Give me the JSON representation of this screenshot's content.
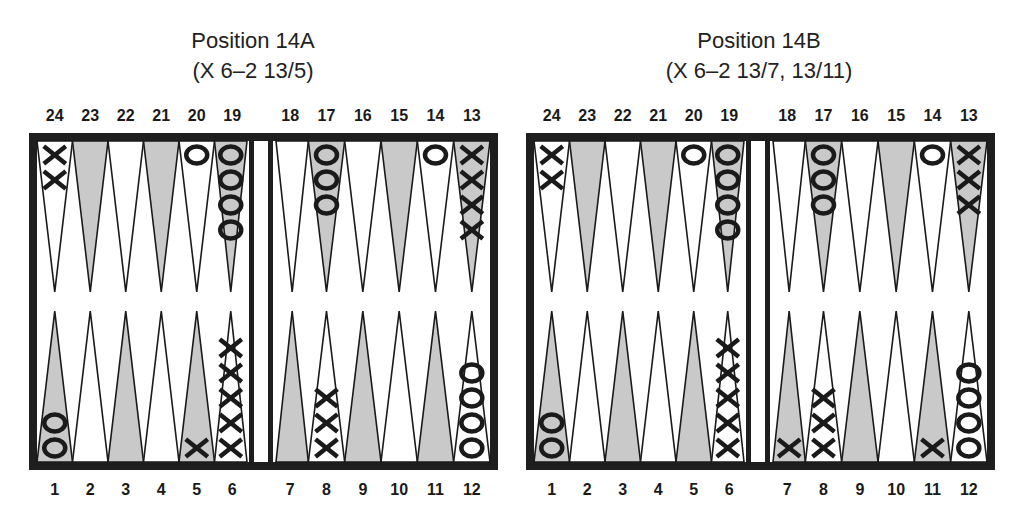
{
  "colors": {
    "frame": "#1e1e1e",
    "shaded_point": "#c9c9c9",
    "plain_point": "#ffffff",
    "background": "#ffffff",
    "ink": "#1a1a1a"
  },
  "panels": [
    {
      "id": "14A",
      "title": "Position 14A",
      "subtitle": "(X 6–2 13/5)",
      "top_numbers": [
        "24",
        "23",
        "22",
        "21",
        "20",
        "19",
        "18",
        "17",
        "16",
        "15",
        "14",
        "13"
      ],
      "bottom_numbers": [
        "1",
        "2",
        "3",
        "4",
        "5",
        "6",
        "7",
        "8",
        "9",
        "10",
        "11",
        "12"
      ],
      "points": {
        "1": {
          "player": "O",
          "count": 2
        },
        "2": {
          "player": "",
          "count": 0
        },
        "3": {
          "player": "",
          "count": 0
        },
        "4": {
          "player": "",
          "count": 0
        },
        "5": {
          "player": "X",
          "count": 1
        },
        "6": {
          "player": "X",
          "count": 5
        },
        "7": {
          "player": "",
          "count": 0
        },
        "8": {
          "player": "X",
          "count": 3
        },
        "9": {
          "player": "",
          "count": 0
        },
        "10": {
          "player": "",
          "count": 0
        },
        "11": {
          "player": "",
          "count": 0
        },
        "12": {
          "player": "O",
          "count": 4
        },
        "13": {
          "player": "X",
          "count": 4
        },
        "14": {
          "player": "O",
          "count": 1
        },
        "15": {
          "player": "",
          "count": 0
        },
        "16": {
          "player": "",
          "count": 0
        },
        "17": {
          "player": "O",
          "count": 3
        },
        "18": {
          "player": "",
          "count": 0
        },
        "19": {
          "player": "O",
          "count": 4
        },
        "20": {
          "player": "O",
          "count": 1
        },
        "21": {
          "player": "",
          "count": 0
        },
        "22": {
          "player": "",
          "count": 0
        },
        "23": {
          "player": "",
          "count": 0
        },
        "24": {
          "player": "X",
          "count": 2
        }
      }
    },
    {
      "id": "14B",
      "title": "Position 14B",
      "subtitle": "(X 6–2 13/7, 13/11)",
      "top_numbers": [
        "24",
        "23",
        "22",
        "21",
        "20",
        "19",
        "18",
        "17",
        "16",
        "15",
        "14",
        "13"
      ],
      "bottom_numbers": [
        "1",
        "2",
        "3",
        "4",
        "5",
        "6",
        "7",
        "8",
        "9",
        "10",
        "11",
        "12"
      ],
      "points": {
        "1": {
          "player": "O",
          "count": 2
        },
        "2": {
          "player": "",
          "count": 0
        },
        "3": {
          "player": "",
          "count": 0
        },
        "4": {
          "player": "",
          "count": 0
        },
        "5": {
          "player": "",
          "count": 0
        },
        "6": {
          "player": "X",
          "count": 5
        },
        "7": {
          "player": "X",
          "count": 1
        },
        "8": {
          "player": "X",
          "count": 3
        },
        "9": {
          "player": "",
          "count": 0
        },
        "10": {
          "player": "",
          "count": 0
        },
        "11": {
          "player": "X",
          "count": 1
        },
        "12": {
          "player": "O",
          "count": 4
        },
        "13": {
          "player": "X",
          "count": 3
        },
        "14": {
          "player": "O",
          "count": 1
        },
        "15": {
          "player": "",
          "count": 0
        },
        "16": {
          "player": "",
          "count": 0
        },
        "17": {
          "player": "O",
          "count": 3
        },
        "18": {
          "player": "",
          "count": 0
        },
        "19": {
          "player": "O",
          "count": 4
        },
        "20": {
          "player": "O",
          "count": 1
        },
        "21": {
          "player": "",
          "count": 0
        },
        "22": {
          "player": "",
          "count": 0
        },
        "23": {
          "player": "",
          "count": 0
        },
        "24": {
          "player": "X",
          "count": 2
        }
      }
    }
  ]
}
